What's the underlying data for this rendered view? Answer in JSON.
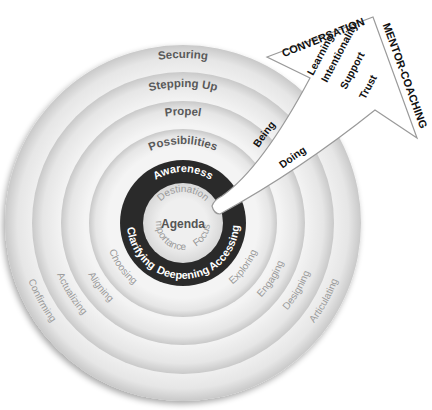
{
  "diagram": {
    "center_label": "Agenda",
    "inner_ring": {
      "labels": [
        "Destination",
        "Focus",
        "Importance"
      ]
    },
    "dark_ring": {
      "top_label": "Awareness",
      "bottom_labels": [
        "Clarifying",
        "Deepening",
        "Accessing"
      ]
    },
    "rings": [
      {
        "top_label": "Possibilities",
        "left_label": "Choosing",
        "right_label": "Exploring"
      },
      {
        "top_label": "Propel",
        "left_label": "Aligning",
        "right_label": "Engaging"
      },
      {
        "top_label": "Stepping Up",
        "left_label": "Actualizing",
        "right_label": "Designing"
      },
      {
        "top_label": "Securing",
        "left_label": "Confirming",
        "right_label": "Articulating"
      }
    ],
    "arrow": {
      "top_label": "CONVERSATION",
      "side_label": "MENTOR-COACHING",
      "stack_labels": [
        "Learning",
        "Intentionality",
        "Support",
        "Trust"
      ],
      "shaft_labels": [
        "Being",
        "Doing"
      ]
    }
  },
  "colors": {
    "ring_light": "#f0f0f0",
    "ring_shadow": "#bdbdbd",
    "dark_ring": "#2b2b2b",
    "inner_circle": "#e9e9e9",
    "bold_text": "#555555",
    "light_text": "#8a8a8a",
    "arrow_fill": "#ffffff",
    "arrow_stroke": "#9a9a9a",
    "arrow_text": "#111111"
  }
}
